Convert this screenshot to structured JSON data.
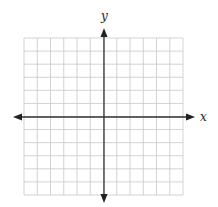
{
  "diagram": {
    "type": "coordinate-plane",
    "x_axis_label": "x",
    "y_axis_label": "y",
    "grid": {
      "columns": 12,
      "rows": 12,
      "x_min": 24,
      "x_max": 183,
      "y_min": 38,
      "y_max": 195
    },
    "colors": {
      "grid": "#c8c8c8",
      "axis": "#333333",
      "background": "#ffffff"
    }
  }
}
